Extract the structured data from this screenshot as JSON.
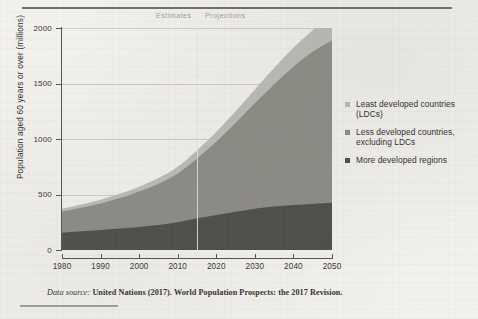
{
  "figure": {
    "caption_italic": "Data source:",
    "caption_rest": " United Nations (2017). World Population Prospects: the 2017 Revision."
  },
  "legend": {
    "position": "right",
    "items": [
      {
        "label": "Least developed countries (LDCs)",
        "color": "#bcbbb5",
        "swatch_name": "legend-swatch-ldc"
      },
      {
        "label": "Less developed countries, excluding LDCs",
        "color": "#8c8b85",
        "swatch_name": "legend-swatch-less-developed"
      },
      {
        "label": "More developed regions",
        "color": "#4e4d49",
        "swatch_name": "legend-swatch-more-developed"
      }
    ]
  },
  "annotations": {
    "estimates": "Estimates",
    "projections": "Projections",
    "divider_year": 2015
  },
  "chart_data": {
    "type": "area",
    "stacked": true,
    "title": "",
    "subtitle": "",
    "xlabel": "",
    "ylabel": "Population aged 60 years or over (millions)",
    "xlim": [
      1980,
      2050
    ],
    "ylim": [
      0,
      2000
    ],
    "xticks": [
      1980,
      1990,
      2000,
      2010,
      2020,
      2030,
      2040,
      2050
    ],
    "yticks": [
      0,
      500,
      1000,
      1500,
      2000
    ],
    "grid": true,
    "x": [
      1980,
      1985,
      1990,
      1995,
      2000,
      2005,
      2010,
      2015,
      2020,
      2025,
      2030,
      2035,
      2040,
      2045,
      2050
    ],
    "series": [
      {
        "name": "More developed regions",
        "color": "#4e4d49",
        "values": [
          155,
          168,
          180,
          193,
          208,
          225,
          250,
          285,
          315,
          345,
          372,
          392,
          405,
          415,
          425
        ]
      },
      {
        "name": "Less developed countries, excluding LDCs",
        "color": "#8c8b85",
        "values": [
          190,
          212,
          240,
          275,
          318,
          372,
          440,
          540,
          660,
          800,
          950,
          1100,
          1245,
          1370,
          1465
        ]
      },
      {
        "name": "Least developed countries (LDCs)",
        "color": "#bcbbb5",
        "values": [
          26,
          29,
          33,
          38,
          44,
          51,
          60,
          72,
          88,
          105,
          125,
          148,
          172,
          195,
          215
        ]
      }
    ],
    "totals": [
      371,
      409,
      453,
      506,
      570,
      648,
      750,
      897,
      1063,
      1250,
      1447,
      1640,
      1822,
      1980,
      2105
    ]
  }
}
